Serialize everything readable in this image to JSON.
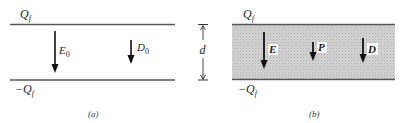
{
  "panel_a": {
    "top_charge": "Q",
    "top_charge_sub": "f",
    "bottom_charge": "−Q",
    "bottom_charge_sub": "f",
    "field_label": "E",
    "field_sub": "0",
    "displacement_label": "D",
    "displacement_sub": "0",
    "caption": "(a)"
  },
  "dimension": {
    "label": "d"
  },
  "panel_b": {
    "top_charge": "Q",
    "top_charge_sub": "f",
    "bottom_charge": "−Q",
    "bottom_charge_sub": "f",
    "field_label": "E",
    "polarization_label": "P",
    "displacement_label": "D",
    "caption": "(b)",
    "fill_color": "#c8c8c8"
  },
  "colors": {
    "line": "#555555",
    "arrow": "#111111",
    "dielectric": "#c8c8c8"
  }
}
